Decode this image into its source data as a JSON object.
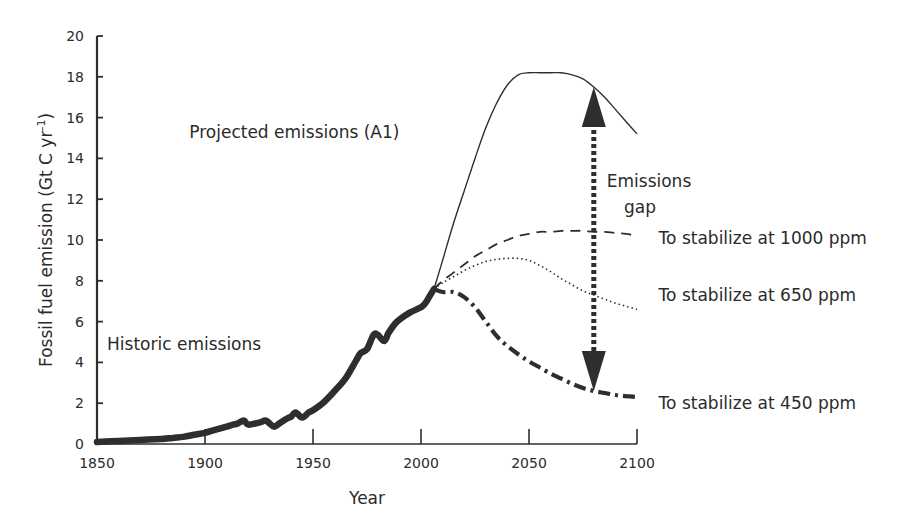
{
  "chart_data": {
    "type": "line",
    "title": "",
    "xlabel": "Year",
    "ylabel": "Fossil fuel emission (Gt C yr",
    "ylabel_superscript": "-1",
    "ylabel_suffix": ")",
    "xlim": [
      1850,
      2100
    ],
    "ylim": [
      0,
      20
    ],
    "x_ticks": [
      1850,
      1900,
      1950,
      2000,
      2050,
      2100
    ],
    "y_ticks": [
      0,
      2,
      4,
      6,
      8,
      10,
      12,
      14,
      16,
      18,
      20
    ],
    "grid": false,
    "legend": "none (inline labels)",
    "series": [
      {
        "name": "Historic emissions",
        "style": "thick-solid",
        "x": [
          1850,
          1860,
          1870,
          1880,
          1885,
          1890,
          1895,
          1900,
          1905,
          1910,
          1913,
          1915,
          1918,
          1920,
          1925,
          1928,
          1930,
          1932,
          1935,
          1938,
          1940,
          1942,
          1945,
          1948,
          1950,
          1955,
          1960,
          1965,
          1970,
          1972,
          1975,
          1978,
          1980,
          1983,
          1985,
          1988,
          1990,
          1995,
          2000,
          2002,
          2004,
          2006
        ],
        "y": [
          0.1,
          0.15,
          0.2,
          0.25,
          0.3,
          0.35,
          0.45,
          0.55,
          0.7,
          0.85,
          0.95,
          1.0,
          1.15,
          0.95,
          1.05,
          1.15,
          1.0,
          0.85,
          1.05,
          1.25,
          1.35,
          1.55,
          1.3,
          1.55,
          1.65,
          2.05,
          2.6,
          3.2,
          4.1,
          4.45,
          4.65,
          5.35,
          5.35,
          5.05,
          5.45,
          5.9,
          6.1,
          6.45,
          6.7,
          6.9,
          7.25,
          7.6
        ]
      },
      {
        "name": "Projected emissions (A1)",
        "style": "thin-solid",
        "x": [
          2006,
          2010,
          2015,
          2020,
          2025,
          2030,
          2035,
          2040,
          2045,
          2050,
          2055,
          2060,
          2065,
          2070,
          2075,
          2080,
          2085,
          2090,
          2095,
          2100
        ],
        "y": [
          7.6,
          9.0,
          10.8,
          12.4,
          14.0,
          15.5,
          16.7,
          17.6,
          18.1,
          18.2,
          18.2,
          18.2,
          18.2,
          18.1,
          17.9,
          17.5,
          17.0,
          16.4,
          15.8,
          15.2
        ]
      },
      {
        "name": "To stabilize at 1000 ppm",
        "style": "dashed",
        "x": [
          2006,
          2010,
          2015,
          2020,
          2025,
          2030,
          2035,
          2040,
          2045,
          2050,
          2055,
          2060,
          2065,
          2070,
          2075,
          2080,
          2085,
          2090,
          2095,
          2100
        ],
        "y": [
          7.6,
          8.0,
          8.4,
          8.8,
          9.2,
          9.5,
          9.8,
          10.0,
          10.2,
          10.3,
          10.4,
          10.4,
          10.45,
          10.45,
          10.45,
          10.4,
          10.4,
          10.35,
          10.3,
          10.2
        ]
      },
      {
        "name": "To stabilize at 650 ppm",
        "style": "dotted",
        "x": [
          2006,
          2010,
          2015,
          2020,
          2025,
          2030,
          2035,
          2040,
          2045,
          2050,
          2055,
          2060,
          2065,
          2070,
          2075,
          2080,
          2085,
          2090,
          2095,
          2100
        ],
        "y": [
          7.6,
          7.9,
          8.2,
          8.5,
          8.75,
          8.95,
          9.05,
          9.1,
          9.1,
          9.0,
          8.75,
          8.45,
          8.1,
          7.8,
          7.5,
          7.3,
          7.1,
          6.9,
          6.75,
          6.6
        ]
      },
      {
        "name": "To stabilize at 450 ppm",
        "style": "thick-dash-dot",
        "x": [
          2006,
          2010,
          2015,
          2020,
          2025,
          2030,
          2035,
          2040,
          2045,
          2050,
          2055,
          2060,
          2065,
          2070,
          2075,
          2080,
          2085,
          2090,
          2095,
          2100
        ],
        "y": [
          7.6,
          7.45,
          7.45,
          7.2,
          6.7,
          6.0,
          5.3,
          4.8,
          4.4,
          4.05,
          3.75,
          3.45,
          3.2,
          2.95,
          2.75,
          2.6,
          2.5,
          2.4,
          2.35,
          2.3
        ]
      }
    ],
    "annotations": [
      {
        "text": "Projected emissions (A1)",
        "anchor_x": 1990,
        "anchor_y": 15.0
      },
      {
        "text": "Historic emissions",
        "anchor_x": 1926,
        "anchor_y": 4.6
      },
      {
        "text": "Emissions",
        "anchor_x": 2086,
        "anchor_y": 12.6
      },
      {
        "text": "gap",
        "anchor_x": 2094,
        "anchor_y": 11.3
      },
      {
        "text": "To stabilize at 1000 ppm",
        "anchor_x": 2110,
        "anchor_y": 9.8
      },
      {
        "text": "To stabilize at 650 ppm",
        "anchor_x": 2110,
        "anchor_y": 7.0
      },
      {
        "text": "To stabilize at 450 ppm",
        "anchor_x": 2110,
        "anchor_y": 1.7
      }
    ],
    "gap_arrow": {
      "x": 2080,
      "y_top": 17.5,
      "y_bottom": 2.6,
      "label": "Emissions gap"
    }
  }
}
